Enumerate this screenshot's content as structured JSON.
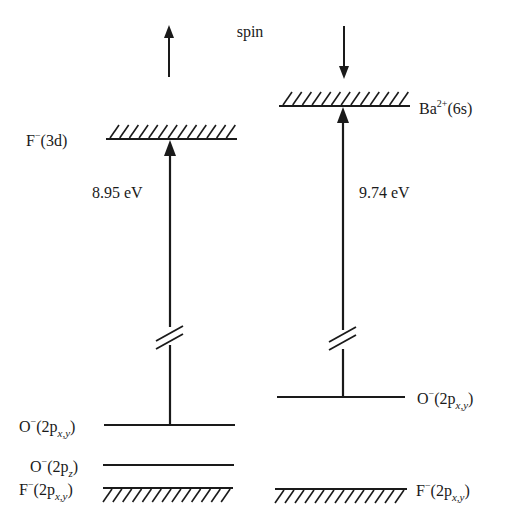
{
  "diagram": {
    "type": "energy-level-diagram",
    "header": {
      "spin_label": "spin",
      "left_spin": "up",
      "right_spin": "down"
    },
    "columns": [
      {
        "id": "spin-up",
        "upper_level": {
          "species": "F",
          "charge": "−",
          "orbital": "(3d)",
          "style": "hatched-above"
        },
        "transition": {
          "energy": "8.95 eV"
        },
        "lower_levels": [
          {
            "species": "O",
            "charge": "−",
            "orbital_main": "(2p",
            "orbital_sub": "x,y",
            "orbital_close": ")",
            "style": "solid"
          },
          {
            "species": "O",
            "charge": "−",
            "orbital_main": "(2p",
            "orbital_sub": "z",
            "orbital_close": ")",
            "style": "solid"
          },
          {
            "species": "F",
            "charge": "−",
            "orbital_main": "(2p",
            "orbital_sub": "x,y",
            "orbital_close": ")",
            "style": "hatched-below"
          }
        ]
      },
      {
        "id": "spin-down",
        "upper_level": {
          "species": "Ba",
          "charge": "2+",
          "orbital": "(6s)",
          "style": "hatched-above"
        },
        "transition": {
          "energy": "9.74 eV"
        },
        "lower_levels": [
          {
            "species": "O",
            "charge": "−",
            "orbital_main": "(2p",
            "orbital_sub": "x,y",
            "orbital_close": ")",
            "style": "solid"
          },
          {
            "species": "F",
            "charge": "−",
            "orbital_main": "(2p",
            "orbital_sub": "x,y",
            "orbital_close": ")",
            "style": "hatched-below"
          }
        ]
      }
    ],
    "colors": {
      "ink": "#1a1a1a",
      "background": "#ffffff"
    }
  }
}
